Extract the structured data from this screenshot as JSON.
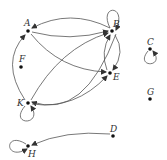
{
  "diagram": {
    "type": "directed-graph",
    "nodes": [
      {
        "id": "A",
        "label": "A",
        "x": 28,
        "y": 31,
        "lx": 24,
        "ly": 26
      },
      {
        "id": "B",
        "label": "B",
        "x": 112,
        "y": 31,
        "lx": 113,
        "ly": 27
      },
      {
        "id": "C",
        "label": "C",
        "x": 150,
        "y": 49,
        "lx": 147,
        "ly": 45
      },
      {
        "id": "E",
        "label": "E",
        "x": 110,
        "y": 73,
        "lx": 113,
        "ly": 80
      },
      {
        "id": "F",
        "label": "F",
        "x": 21,
        "y": 67,
        "lx": 19,
        "ly": 62
      },
      {
        "id": "G",
        "label": "G",
        "x": 150,
        "y": 99,
        "lx": 147,
        "ly": 95
      },
      {
        "id": "K",
        "label": "K",
        "x": 28,
        "y": 103,
        "lx": 17,
        "ly": 106
      },
      {
        "id": "D",
        "label": "D",
        "x": 113,
        "y": 136,
        "lx": 110,
        "ly": 132
      },
      {
        "id": "H",
        "label": "H",
        "x": 28,
        "y": 146,
        "lx": 28,
        "ly": 157
      }
    ],
    "edges": [
      {
        "from": "B",
        "to": "A",
        "kind": "arc",
        "path": "M 110 28 Q 70 8 32 28"
      },
      {
        "from": "A",
        "to": "B",
        "kind": "arc",
        "path": "M 32 32 Q 70 42 108 31"
      },
      {
        "from": "A",
        "to": "E",
        "kind": "arc",
        "path": "M 31 34 Q 60 70 106 72"
      },
      {
        "from": "K",
        "to": "B",
        "kind": "arc",
        "path": "M 31 100 Q 60 48 108 33"
      },
      {
        "from": "B",
        "to": "E",
        "kind": "arc",
        "path": "M 115 35 Q 126 52 113 70"
      },
      {
        "from": "E",
        "to": "B",
        "kind": "arc",
        "path": "M 107 70 Q 100 52 110 35"
      },
      {
        "from": "B",
        "to": "K",
        "kind": "arc",
        "path": "M 116 34 Q 84 120 32 102"
      },
      {
        "from": "K",
        "to": "A",
        "kind": "arc",
        "path": "M 25 100 Q 0 62 25 35"
      },
      {
        "from": "K",
        "to": "E",
        "kind": "arc",
        "path": "M 32 104 Q 75 110 107 76"
      },
      {
        "from": "D",
        "to": "H",
        "kind": "arc",
        "path": "M 110 134 Q 65 130 32 145"
      },
      {
        "from": "B",
        "to": "B",
        "kind": "loop",
        "path": "M 110 28 C 98 4 128 4 116 30"
      },
      {
        "from": "C",
        "to": "C",
        "kind": "loop",
        "path": "M 148 51 C 134 68 166 68 153 51"
      },
      {
        "from": "K",
        "to": "K",
        "kind": "loop",
        "path": "M 25 106 C 8 126 44 126 31 106"
      },
      {
        "from": "H",
        "to": "H",
        "kind": "loop",
        "path": "M 26 144 C 4 130 4 162 27 149"
      }
    ],
    "isolated_nodes": [
      "F",
      "G"
    ]
  }
}
